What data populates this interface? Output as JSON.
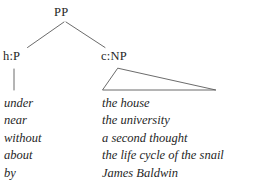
{
  "diagram": {
    "type": "syntactic-tree",
    "title_node": "PP",
    "nodes": {
      "root": {
        "label": "PP"
      },
      "head": {
        "label": "h:P"
      },
      "complement": {
        "label": "c:NP"
      }
    },
    "edges": [
      {
        "from": "PP",
        "to": "h:P",
        "style": "line"
      },
      {
        "from": "PP",
        "to": "c:NP",
        "style": "line"
      },
      {
        "from": "h:P",
        "to": "head-words",
        "style": "vertical-stem"
      },
      {
        "from": "c:NP",
        "to": "comp-phrases",
        "style": "triangle"
      }
    ],
    "head_words": [
      "under",
      "near",
      "without",
      "about",
      "by"
    ],
    "complement_phrases": [
      "the house",
      "the university",
      "a second thought",
      "the life cycle of the snail",
      "James Baldwin"
    ],
    "colors": {
      "background": "#ffffff",
      "text": "#262626",
      "line": "#5a5a5a"
    }
  }
}
